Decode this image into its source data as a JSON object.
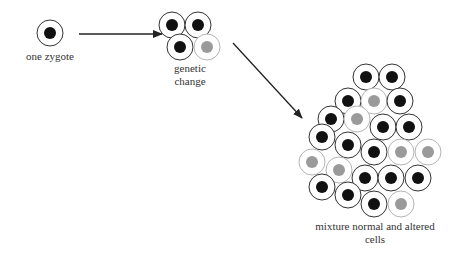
{
  "labels": {
    "zygote": "one zygote",
    "genetic_line1": "genetic",
    "genetic_line2": "change",
    "mixture_line1": "mixture normal and altered",
    "mixture_line2": "cells"
  },
  "colors": {
    "normal_nucleus": "#111111",
    "altered_nucleus": "#9a9a9a",
    "normal_outline": "#333333",
    "altered_outline": "#b5b5b5",
    "arrow": "#222222"
  },
  "stages": [
    {
      "name": "zygote",
      "cells": [
        {
          "x": 50,
          "y": 33,
          "type": "normal"
        }
      ]
    },
    {
      "name": "genetic-change",
      "cells": [
        {
          "x": 172,
          "y": 25,
          "type": "normal"
        },
        {
          "x": 198,
          "y": 25,
          "type": "normal"
        },
        {
          "x": 180,
          "y": 47,
          "type": "normal"
        },
        {
          "x": 207,
          "y": 47,
          "type": "altered"
        }
      ]
    },
    {
      "name": "mixture",
      "cells": [
        {
          "x": 366,
          "y": 77,
          "type": "normal"
        },
        {
          "x": 392,
          "y": 77,
          "type": "normal"
        },
        {
          "x": 348,
          "y": 101,
          "type": "normal"
        },
        {
          "x": 374,
          "y": 101,
          "type": "altered"
        },
        {
          "x": 400,
          "y": 101,
          "type": "normal"
        },
        {
          "x": 331,
          "y": 119,
          "type": "normal"
        },
        {
          "x": 357,
          "y": 119,
          "type": "altered"
        },
        {
          "x": 383,
          "y": 127,
          "type": "normal"
        },
        {
          "x": 409,
          "y": 127,
          "type": "normal"
        },
        {
          "x": 322,
          "y": 137,
          "type": "normal"
        },
        {
          "x": 348,
          "y": 145,
          "type": "normal"
        },
        {
          "x": 374,
          "y": 152,
          "type": "normal"
        },
        {
          "x": 401,
          "y": 152,
          "type": "altered"
        },
        {
          "x": 428,
          "y": 152,
          "type": "altered"
        },
        {
          "x": 312,
          "y": 162,
          "type": "altered"
        },
        {
          "x": 339,
          "y": 170,
          "type": "altered"
        },
        {
          "x": 365,
          "y": 178,
          "type": "normal"
        },
        {
          "x": 391,
          "y": 178,
          "type": "normal"
        },
        {
          "x": 418,
          "y": 178,
          "type": "normal"
        },
        {
          "x": 322,
          "y": 187,
          "type": "normal"
        },
        {
          "x": 348,
          "y": 195,
          "type": "normal"
        },
        {
          "x": 374,
          "y": 204,
          "type": "normal"
        },
        {
          "x": 401,
          "y": 204,
          "type": "altered"
        }
      ]
    }
  ],
  "arrows": [
    {
      "name": "zygote-to-genetic-change",
      "x1": 79,
      "y1": 34,
      "x2": 162,
      "y2": 34
    },
    {
      "name": "genetic-change-to-mixture",
      "x1": 233,
      "y1": 43,
      "x2": 302,
      "y2": 118
    }
  ]
}
